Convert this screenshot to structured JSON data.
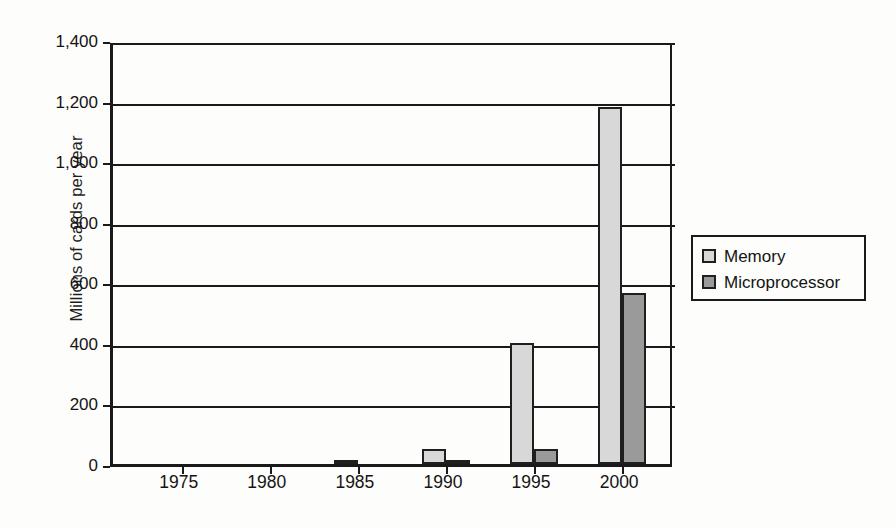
{
  "chart_data": {
    "type": "bar",
    "title": "",
    "subtitle": "",
    "xlabel": "",
    "ylabel": "Millions of cards per year",
    "categories": [
      "1975",
      "1980",
      "1985",
      "1990",
      "1995",
      "2000"
    ],
    "series": [
      {
        "name": "Memory",
        "color": "#d8d8d8",
        "values": [
          0,
          0,
          5,
          50,
          400,
          1180
        ]
      },
      {
        "name": "Microprocessor",
        "color": "#9a9a9a",
        "values": [
          0,
          0,
          0,
          2,
          50,
          565
        ]
      }
    ],
    "ylim": [
      0,
      1400
    ],
    "ytick_values": [
      0,
      200,
      400,
      600,
      800,
      1000,
      1200,
      1400
    ],
    "ytick_labels": [
      "0",
      "200",
      "400",
      "600",
      "800",
      "1,000",
      "1,200",
      "1,400"
    ],
    "grid": true,
    "legend_position": "right",
    "legend_entries": [
      "Memory",
      "Microprocessor"
    ]
  },
  "axis": {
    "y_title": "Millions of cards per year"
  },
  "legend": {
    "items": [
      {
        "label": "Memory"
      },
      {
        "label": "Microprocessor"
      }
    ]
  }
}
